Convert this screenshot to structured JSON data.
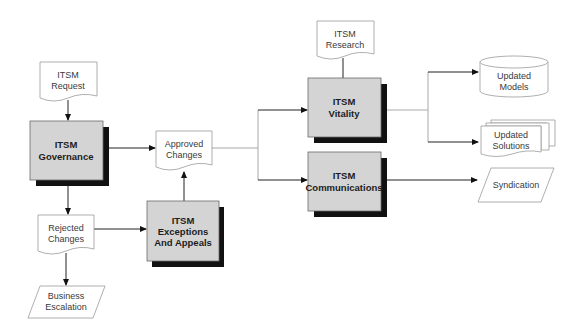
{
  "diagram": {
    "type": "flowchart",
    "nodes": {
      "itsm_request": {
        "shape": "document",
        "lines": [
          "ITSM",
          "Request"
        ]
      },
      "itsm_governance": {
        "shape": "process",
        "lines": [
          "ITSM",
          "Governance"
        ]
      },
      "approved_changes": {
        "shape": "document",
        "lines": [
          "Approved",
          "Changes"
        ]
      },
      "rejected_changes": {
        "shape": "document",
        "lines": [
          "Rejected",
          "Changes"
        ]
      },
      "business_escalation": {
        "shape": "data",
        "lines": [
          "Business",
          "Escalation"
        ]
      },
      "itsm_exceptions": {
        "shape": "process",
        "lines": [
          "ITSM",
          "Exceptions",
          "And Appeals"
        ]
      },
      "itsm_research": {
        "shape": "document",
        "lines": [
          "ITSM",
          "Research"
        ]
      },
      "itsm_vitality": {
        "shape": "process",
        "lines": [
          "ITSM",
          "Vitality"
        ]
      },
      "itsm_communications": {
        "shape": "process",
        "lines": [
          "ITSM",
          "Communications"
        ]
      },
      "updated_models": {
        "shape": "database",
        "lines": [
          "Updated",
          "Models"
        ]
      },
      "updated_solutions": {
        "shape": "multi-document",
        "lines": [
          "Updated",
          "Solutions"
        ]
      },
      "syndication": {
        "shape": "data",
        "lines": [
          "Syndication"
        ]
      }
    },
    "edges": [
      {
        "from": "itsm_request",
        "to": "itsm_governance"
      },
      {
        "from": "itsm_governance",
        "to": "approved_changes"
      },
      {
        "from": "itsm_governance",
        "to": "rejected_changes"
      },
      {
        "from": "rejected_changes",
        "to": "itsm_exceptions"
      },
      {
        "from": "rejected_changes",
        "to": "business_escalation"
      },
      {
        "from": "itsm_exceptions",
        "to": "approved_changes"
      },
      {
        "from": "approved_changes",
        "to": "itsm_vitality"
      },
      {
        "from": "approved_changes",
        "to": "itsm_communications"
      },
      {
        "from": "itsm_research",
        "to": "itsm_vitality"
      },
      {
        "from": "itsm_vitality",
        "to": "updated_models"
      },
      {
        "from": "itsm_vitality",
        "to": "updated_solutions"
      },
      {
        "from": "itsm_communications",
        "to": "syndication"
      }
    ]
  }
}
